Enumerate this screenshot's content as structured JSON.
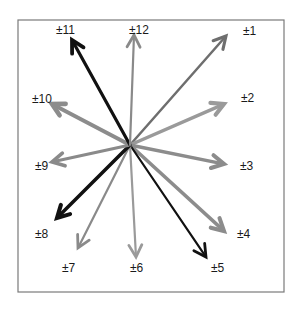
{
  "diagram": {
    "title": "",
    "frame": {
      "x": 18,
      "y": 20,
      "width": 266,
      "height": 272,
      "stroke": "#7a7a7a"
    },
    "center": {
      "x": 130,
      "y": 145
    },
    "arrows": [
      {
        "label": "±1",
        "tip": [
          226,
          36
        ],
        "label_pos": [
          243,
          35
        ],
        "color": "#6e6e6e",
        "width": 2.5
      },
      {
        "label": "±2",
        "tip": [
          224,
          104
        ],
        "label_pos": [
          241,
          102
        ],
        "color": "#9a9a9a",
        "width": 3.5
      },
      {
        "label": "±3",
        "tip": [
          224,
          164
        ],
        "label_pos": [
          240,
          170
        ],
        "color": "#8c8c8c",
        "width": 3.5
      },
      {
        "label": "±4",
        "tip": [
          224,
          231
        ],
        "label_pos": [
          237,
          238
        ],
        "color": "#8c8c8c",
        "width": 3.5
      },
      {
        "label": "±5",
        "tip": [
          206,
          257
        ],
        "label_pos": [
          211,
          272
        ],
        "color": "#111111",
        "width": 2.2
      },
      {
        "label": "±6",
        "tip": [
          136,
          257
        ],
        "label_pos": [
          130,
          272
        ],
        "color": "#9a9a9a",
        "width": 2.2
      },
      {
        "label": "±7",
        "tip": [
          78,
          248
        ],
        "label_pos": [
          62,
          272
        ],
        "color": "#8a8a8a",
        "width": 2.2
      },
      {
        "label": "±8",
        "tip": [
          57,
          218
        ],
        "label_pos": [
          35,
          238
        ],
        "color": "#111111",
        "width": 3.5
      },
      {
        "label": "±9",
        "tip": [
          52,
          162
        ],
        "label_pos": [
          35,
          170
        ],
        "color": "#8a8a8a",
        "width": 3.0
      },
      {
        "label": "±10",
        "tip": [
          52,
          104
        ],
        "label_pos": [
          32,
          103
        ],
        "color": "#8c8c8c",
        "width": 4.0
      },
      {
        "label": "±11",
        "tip": [
          72,
          40
        ],
        "label_pos": [
          56,
          34
        ],
        "color": "#111111",
        "width": 3.2
      },
      {
        "label": "±12",
        "tip": [
          134,
          35
        ],
        "label_pos": [
          129,
          34
        ],
        "color": "#8a8a8a",
        "width": 2.2
      }
    ]
  }
}
